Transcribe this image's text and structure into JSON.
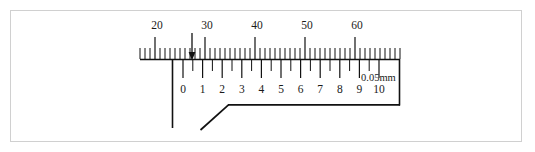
{
  "figure": {
    "type": "vernier-caliper-scale",
    "title": "",
    "unit_label": "0.05mm",
    "main_scale": {
      "name": "main-scale",
      "labels": [
        "20",
        "30",
        "40",
        "50",
        "60"
      ],
      "label_values": [
        20,
        30,
        40,
        50,
        60
      ],
      "label_x": [
        157,
        207,
        257,
        307,
        357
      ],
      "tick_start_x": 140,
      "tick_end_x": 400,
      "tick_spacing_px": 5,
      "major_every": 10,
      "baseline_y": 59,
      "minor_tick_len": 11,
      "major_tick_len": 22,
      "label_y": 20
    },
    "vernier_scale": {
      "name": "vernier-scale",
      "labels": [
        "0",
        "1",
        "2",
        "3",
        "4",
        "5",
        "6",
        "7",
        "8",
        "9",
        "10"
      ],
      "label_values": [
        0,
        1,
        2,
        3,
        4,
        5,
        6,
        7,
        8,
        9,
        10
      ],
      "zero_x": 183,
      "major_spacing_px": 19.6,
      "minor_spacing_px": 9.8,
      "baseline_y": 60,
      "major_tick_len": 18,
      "minor_tick_len": 11,
      "label_y": 84,
      "slider_left_x": 172,
      "slider_right_x": 400,
      "slider_bottom_y": 105
    },
    "indicator": {
      "name": "reading-arrow",
      "x": 192,
      "y_top": 33,
      "y_bottom": 60,
      "direction": "down"
    },
    "jaw": {
      "name": "caliper-jaw",
      "stem_x": 172,
      "stem_top_y": 60,
      "stem_bottom_y": 128,
      "diagonal_from": [
        201,
        130
      ],
      "diagonal_to": [
        228,
        105
      ],
      "horizontal_to": [
        400,
        105
      ]
    },
    "unit_label_pos": {
      "x": 361,
      "y": 73
    }
  }
}
